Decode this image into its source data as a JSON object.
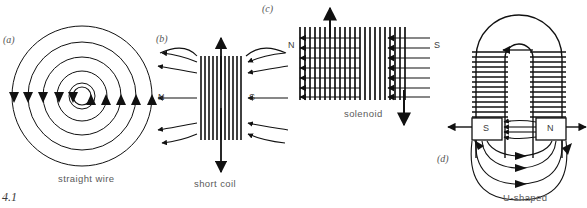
{
  "figure": {
    "number": "4.1",
    "width": 587,
    "height": 208,
    "ink_color": "#111111",
    "text_color": "#5a5a5a"
  },
  "panels": [
    {
      "tag": "(a)",
      "caption": "straight wire",
      "description": "concentric circular field lines around a straight current-carrying wire",
      "circle_count": 5,
      "arrow_direction": "down",
      "poles": []
    },
    {
      "tag": "(b)",
      "caption": "short coil",
      "description": "short coil with diverging field lines, N pole left, S pole right",
      "winding_lines": 11,
      "field_rows": 5,
      "poles": [
        {
          "label": "N",
          "side": "left"
        },
        {
          "label": "S",
          "side": "right"
        }
      ]
    },
    {
      "tag": "(c)",
      "caption": "solenoid",
      "description": "long solenoid with uniform parallel field lines, N pole left, S pole right",
      "winding_lines": 22,
      "field_rows": 7,
      "poles": [
        {
          "label": "N",
          "side": "left"
        },
        {
          "label": "S",
          "side": "right"
        }
      ]
    },
    {
      "tag": "(d)",
      "caption": "U-shaped",
      "description": "U-shaped horseshoe electromagnet with two wound limbs and pole pieces",
      "field_rows": 4,
      "poles": [
        {
          "label": "S",
          "side": "left"
        },
        {
          "label": "N",
          "side": "right"
        }
      ]
    }
  ]
}
